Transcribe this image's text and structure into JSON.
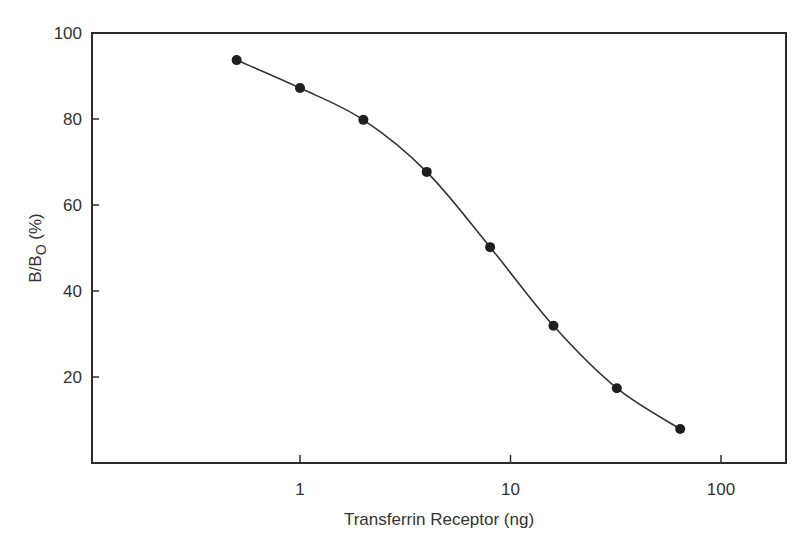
{
  "chart_data": {
    "type": "scatter",
    "title": "",
    "xlabel": "Transferrin Receptor (ng)",
    "ylabel": "B/B0 (%)",
    "ylabel_main": "B/B",
    "ylabel_sub": "O",
    "ylabel_suffix": " (%)",
    "xscale": "log",
    "xlim": [
      0.1,
      204
    ],
    "ylim": [
      0,
      100
    ],
    "x_ticks": [
      1,
      10,
      100
    ],
    "x_tick_labels": [
      "1",
      "10",
      "100"
    ],
    "y_ticks": [
      20,
      40,
      60,
      80,
      100
    ],
    "y_tick_labels": [
      "20",
      "40",
      "60",
      "80",
      "100"
    ],
    "grid": false,
    "legend": null,
    "series": [
      {
        "name": "B/B0",
        "marker": "filled-circle",
        "fit": "smooth sigmoid curve through points",
        "x": [
          0.5,
          1,
          2,
          4,
          8,
          16,
          32,
          64
        ],
        "y": [
          93.7,
          87.2,
          79.8,
          67.7,
          50.2,
          31.9,
          17.4,
          7.9
        ]
      }
    ]
  },
  "colors": {
    "axis": "#2b2b2b",
    "line": "#333333",
    "marker": "#1e1e1e",
    "background": "#ffffff"
  }
}
